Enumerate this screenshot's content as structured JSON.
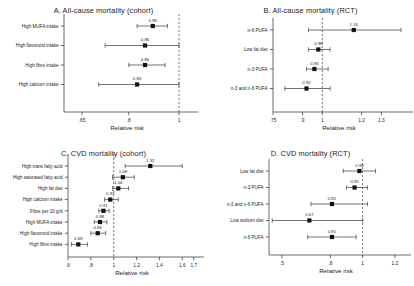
{
  "figure": {
    "background": "#ffffff",
    "axis_color": "#2b2b2b",
    "marker_color": "#121212",
    "refline_color": "#3a3a3a"
  },
  "chart_data": [
    {
      "type": "scatter",
      "panel_id": "A",
      "title": "A. All-cause mortality (cohort)",
      "xlabel": "Relative risk",
      "ylabel": "",
      "xscale": "log",
      "xlim": [
        0.6,
        1.05
      ],
      "xticks": [
        0.65,
        0.8,
        1
      ],
      "xtick_labels": [
        ".65",
        ".8",
        "1"
      ],
      "refline": 1,
      "grid": false,
      "legend": "none",
      "categories": [
        "High MUFA intake",
        "High flavonoid intake",
        "High fibre intake",
        "High calcium intake"
      ],
      "values": [
        0.89,
        0.86,
        0.86,
        0.83
      ],
      "value_labels": [
        "0.89",
        "0.86",
        "0.86",
        "0.83"
      ],
      "ci_low": [
        0.83,
        0.72,
        0.8,
        0.7
      ],
      "ci_high": [
        0.95,
        1.0,
        0.94,
        1.0
      ]
    },
    {
      "type": "scatter",
      "panel_id": "B",
      "title": "B. All-cause mortality (RCT)",
      "xlabel": "Relative risk",
      "ylabel": "",
      "xscale": "linear",
      "xlim": [
        0.75,
        1.42
      ],
      "xticks": [
        0.75,
        0.9,
        1,
        1.2,
        1.3
      ],
      "xtick_labels": [
        ".75",
        ".9",
        "1",
        "1.2",
        "1.3"
      ],
      "refline": 1,
      "grid": false,
      "legend": "none",
      "categories": [
        "n-6 PUFA",
        "Low fat diet",
        "n-3 PUFA",
        "n-3 and n-6 PUFA"
      ],
      "values": [
        1.16,
        0.98,
        0.96,
        0.92
      ],
      "value_labels": [
        "1.16",
        "0.98",
        "0.96",
        "0.92"
      ],
      "ci_low": [
        0.93,
        0.93,
        0.92,
        0.81
      ],
      "ci_high": [
        1.4,
        1.04,
        1.03,
        1.04
      ]
    },
    {
      "type": "scatter",
      "panel_id": "C",
      "title": "C. CVD mortality (cohort)",
      "xlabel": "Relative risk",
      "ylabel": "",
      "xscale": "linear",
      "xlim": [
        0.6,
        1.72
      ],
      "xticks": [
        0.6,
        0.8,
        1,
        1.2,
        1.4,
        1.6,
        1.7
      ],
      "xtick_labels": [
        ".6",
        ".8",
        "1",
        "1.2",
        "1.4",
        "1.6",
        "1.7"
      ],
      "refline": 1,
      "grid": false,
      "legend": "none",
      "categories": [
        "High trans fatty acid",
        "High saturated fatty acid",
        "High fat diet",
        "High calcium intake",
        "Fibre per 10 g/d",
        "High MUFA intake",
        "High flavonoid intake",
        "High fibre intake"
      ],
      "values": [
        1.32,
        1.08,
        1.04,
        0.97,
        0.91,
        0.88,
        0.86,
        0.69
      ],
      "value_labels": [
        "1.32",
        "1.08",
        "1.04",
        "0.97",
        "0.91",
        "0.88",
        "0.86",
        "0.69"
      ],
      "ci_low": [
        1.1,
        0.99,
        0.99,
        0.92,
        0.87,
        0.83,
        0.8,
        0.63
      ],
      "ci_high": [
        1.6,
        1.18,
        1.13,
        1.04,
        0.96,
        0.94,
        0.93,
        0.77
      ]
    },
    {
      "type": "scatter",
      "panel_id": "D",
      "title": "D. CVD mortality (RCT)",
      "xlabel": "Relative risk",
      "ylabel": "",
      "xscale": "linear",
      "xlim": [
        0.42,
        1.25
      ],
      "xticks": [
        0.5,
        0.8,
        1,
        1.2
      ],
      "xtick_labels": [
        ".5",
        ".8",
        "1",
        "1.2"
      ],
      "refline": 1,
      "grid": false,
      "legend": "none",
      "categories": [
        "Low fat diet",
        "n-3 PUFA",
        "n-3 and n-6 PUFA",
        "Low sodium diet",
        "n-6 PUFA"
      ],
      "values": [
        0.98,
        0.95,
        0.81,
        0.67,
        0.81
      ],
      "value_labels": [
        "0.98",
        "0.95",
        "0.81",
        "0.67",
        "0.81"
      ],
      "ci_low": [
        0.88,
        0.9,
        0.68,
        0.44,
        0.66
      ],
      "ci_high": [
        1.08,
        1.03,
        1.03,
        1.0,
        0.96
      ]
    }
  ]
}
